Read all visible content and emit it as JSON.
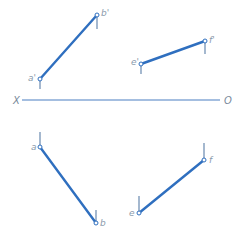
{
  "diagram": {
    "type": "orthographic-projection",
    "colors": {
      "projection_line": "#2f6fbf",
      "axis_line": "#4a7fc1",
      "tick": "#5a7ea8",
      "point_fill": "#ffffff",
      "label": "#8a9aac"
    },
    "axis": {
      "start_label": "X",
      "end_label": "O",
      "x1": 22,
      "x2": 220,
      "y": 100,
      "start_label_x": 13,
      "end_label_x": 224
    },
    "lines": [
      {
        "name": "ab-elevation",
        "p1": {
          "label": "a'",
          "x": 40,
          "y": 79,
          "tick_to": 89,
          "label_x": 28,
          "label_y": 81
        },
        "p2": {
          "label": "b'",
          "x": 97,
          "y": 15,
          "tick_to": 29,
          "label_x": 101,
          "label_y": 16
        }
      },
      {
        "name": "ef-elevation",
        "p1": {
          "label": "e'",
          "x": 141,
          "y": 64,
          "tick_to": 74,
          "label_x": 131,
          "label_y": 65
        },
        "p2": {
          "label": "f'",
          "x": 205,
          "y": 41,
          "tick_to": 54,
          "label_x": 209,
          "label_y": 43
        }
      },
      {
        "name": "ab-plan",
        "p1": {
          "label": "a",
          "x": 40,
          "y": 147,
          "tick_to": 132,
          "label_x": 31,
          "label_y": 150
        },
        "p2": {
          "label": "b",
          "x": 96,
          "y": 223,
          "tick_to": 210,
          "label_x": 100,
          "label_y": 226
        }
      },
      {
        "name": "ef-plan",
        "p1": {
          "label": "e",
          "x": 139,
          "y": 213,
          "tick_to": 196,
          "label_x": 129,
          "label_y": 216
        },
        "p2": {
          "label": "f",
          "x": 204,
          "y": 160,
          "tick_to": 143,
          "label_x": 209,
          "label_y": 163
        }
      }
    ]
  }
}
